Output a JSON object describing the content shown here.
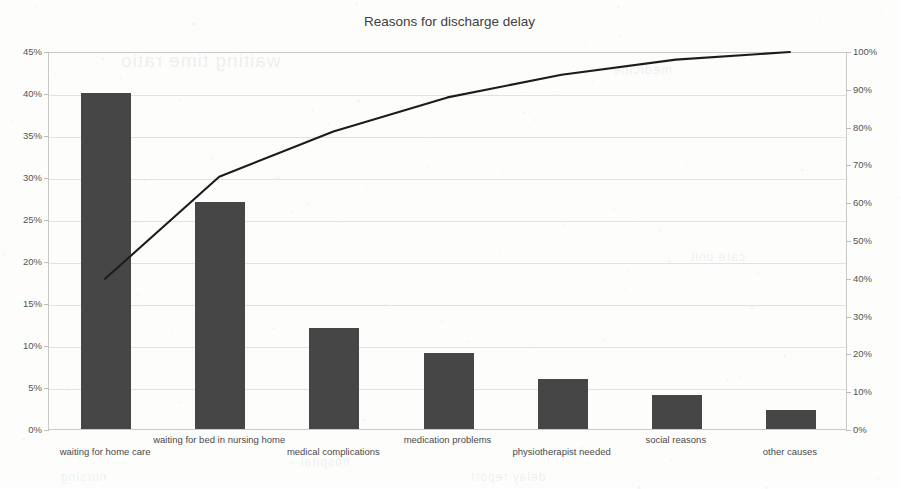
{
  "chart_data": {
    "type": "bar",
    "title": "Reasons for discharge delay",
    "xlabel": "",
    "ylabel": "",
    "categories": [
      "waiting for home care",
      "waiting for bed in nursing home",
      "medical complications",
      "medication problems",
      "physiotherapist needed",
      "social reasons",
      "other causes"
    ],
    "series": [
      {
        "name": "share of delays",
        "type": "bar",
        "axis": "left",
        "values": [
          40,
          27,
          12,
          9,
          6,
          4,
          2.3
        ]
      },
      {
        "name": "cumulative percentage",
        "type": "line",
        "axis": "right",
        "values": [
          40,
          67,
          79,
          88,
          94,
          98,
          100
        ]
      }
    ],
    "left_axis": {
      "ticks": [
        "0%",
        "5%",
        "10%",
        "15%",
        "20%",
        "25%",
        "30%",
        "35%",
        "40%",
        "45%"
      ],
      "tick_values": [
        0,
        5,
        10,
        15,
        20,
        25,
        30,
        35,
        40,
        45
      ],
      "ylim": [
        0,
        45
      ]
    },
    "right_axis": {
      "ticks": [
        "0%",
        "10%",
        "20%",
        "30%",
        "40%",
        "50%",
        "60%",
        "70%",
        "80%",
        "90%",
        "100%"
      ],
      "tick_values": [
        0,
        10,
        20,
        30,
        40,
        50,
        60,
        70,
        80,
        90,
        100
      ],
      "ylim": [
        0,
        100
      ]
    },
    "grid": true,
    "legend": "none",
    "colors": {
      "bar": "#464646",
      "line": "#1c1c1c",
      "grid": "#e2e2e2",
      "frame": "#c9c9c9",
      "text": "#404040",
      "background": "#fdfdfc"
    }
  },
  "background_artifacts": [
    {
      "text": "waiting time ratio",
      "x": 120,
      "y": 50,
      "size": 19
    },
    {
      "text": "medicine",
      "x": 612,
      "y": 62,
      "size": 13
    },
    {
      "text": "care unit",
      "x": 690,
      "y": 250,
      "size": 12
    },
    {
      "text": "hospital",
      "x": 300,
      "y": 455,
      "size": 12
    },
    {
      "text": "delay report",
      "x": 470,
      "y": 470,
      "size": 12
    },
    {
      "text": "nursing",
      "x": 60,
      "y": 470,
      "size": 12
    }
  ]
}
